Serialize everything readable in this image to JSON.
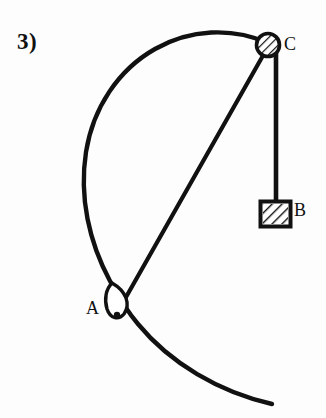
{
  "figure": {
    "problem_number": "3)",
    "background_color": "#fdfdfd",
    "ink_color": "#111111",
    "labels": {
      "a": "A",
      "b": "B",
      "c": "C"
    },
    "elements": {
      "arc_name": "circular-hoop-arc",
      "pulley_name": "pulley-at-c",
      "ring_name": "small-ring-at-a",
      "block_name": "hanging-block-b",
      "cord_chord_name": "cord-segment-a-to-c",
      "cord_vertical_name": "cord-segment-c-to-b"
    },
    "geometry": {
      "arc_path": "M 268 43 C 205 22 126 57 94 133 C 64 204 90 268 117 314 C 147 365 205 397 272 405",
      "chord_path": "M 266 50 L 118 316",
      "vertical_cord_path": "M 276 50 L 276 202",
      "pulley_center_x": 268,
      "pulley_center_y": 45,
      "pulley_radius": 13,
      "ring_center_x": 116,
      "ring_center_y": 301,
      "block_x": 259,
      "block_y": 200,
      "block_w": 33,
      "block_h": 28
    }
  }
}
